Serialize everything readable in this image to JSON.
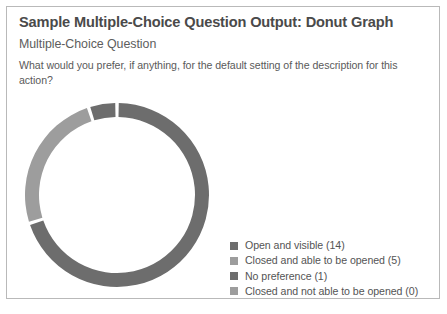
{
  "card": {
    "title": "Sample Multiple-Choice Question Output: Donut Graph",
    "subtitle": "Multiple-Choice Question",
    "question": "What would you prefer, if anything, for the default setting of the description for this action?"
  },
  "colors": {
    "dark": "#6d6d6d",
    "light": "#9d9d9d",
    "border": "#b9b9b9",
    "background": "#ffffff",
    "title_text": "#4a4a4a",
    "body_text": "#5a5a5a"
  },
  "legend": {
    "items": [
      {
        "label": "Open and visible (14)",
        "color": "#6d6d6d"
      },
      {
        "label": "Closed and able to be opened (5)",
        "color": "#9d9d9d"
      },
      {
        "label": "No preference (1)",
        "color": "#6d6d6d"
      },
      {
        "label": "Closed and not able to be opened (0)",
        "color": "#9d9d9d"
      }
    ]
  },
  "chart_data": {
    "type": "pie",
    "variant": "donut",
    "title": "Sample Multiple-Choice Question Output: Donut Graph",
    "categories": [
      "Open and visible",
      "Closed and able to be opened",
      "No preference",
      "Closed and not able to be opened"
    ],
    "values": [
      14,
      5,
      1,
      0
    ],
    "total": 20,
    "percentages": [
      70,
      25,
      5,
      0
    ],
    "colors": [
      "#6d6d6d",
      "#9d9d9d",
      "#6d6d6d",
      "#9d9d9d"
    ],
    "legend_position": "bottom-right",
    "grid": false,
    "xlabel": "",
    "ylabel": "",
    "geometry": {
      "cx": 98,
      "cy": 100,
      "outer_radius": 92,
      "inner_radius": 78,
      "start_angle_deg": -90,
      "gap_deg": 2.2,
      "direction": "clockwise"
    }
  }
}
